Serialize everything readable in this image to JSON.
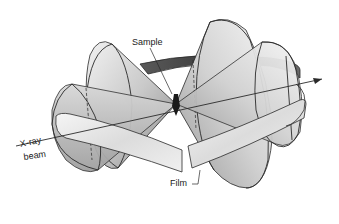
{
  "diagram": {
    "labels": {
      "sample": "Sample",
      "xray": "X-ray",
      "beam": "beam",
      "film": "Film"
    },
    "colors": {
      "background": "#ffffff",
      "outline": "#2a2a2a",
      "cone_light": "#e6e6e6",
      "cone_mid": "#bdbdbd",
      "cone_dark": "#6e6e6e",
      "film_light": "#ededed",
      "film_dark": "#4a4a4a"
    },
    "elements": [
      {
        "name": "x-ray-beam",
        "description": "Straight line entering from left, passing through sample, exiting right with arrowhead"
      },
      {
        "name": "sample",
        "description": "Small dark specimen at center where cones meet"
      },
      {
        "name": "back-reflection-cones",
        "description": "Two nested cones opening to the left"
      },
      {
        "name": "forward-reflection-cones",
        "description": "Two nested cones opening to the right"
      },
      {
        "name": "film-strip",
        "description": "Cylindrical film band encircling the sample with a gap at the front"
      }
    ]
  }
}
